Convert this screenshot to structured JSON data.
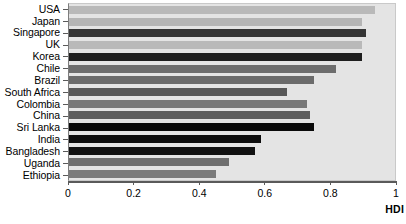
{
  "chart_data": {
    "type": "bar",
    "orientation": "horizontal",
    "title": "",
    "xlabel": "HDI",
    "ylabel": "",
    "xlim": [
      0,
      1
    ],
    "ylim": null,
    "grid": false,
    "legend": null,
    "xticks": [
      0,
      0.2,
      0.4,
      0.6,
      0.8,
      1
    ],
    "xtick_labels": [
      "0",
      "0.2",
      "0.4",
      "0.6",
      "0.8",
      "1"
    ],
    "categories": [
      "USA",
      "Japan",
      "Singapore",
      "UK",
      "Korea",
      "Chile",
      "Brazil",
      "South Africa",
      "Colombia",
      "China",
      "Sri Lanka",
      "India",
      "Bangladesh",
      "Uganda",
      "Ethiopia"
    ],
    "values": [
      0.94,
      0.9,
      0.91,
      0.9,
      0.9,
      0.82,
      0.75,
      0.67,
      0.73,
      0.74,
      0.75,
      0.59,
      0.57,
      0.49,
      0.45
    ],
    "bar_colors": [
      "#b9b9b9",
      "#b5b5b5",
      "#353535",
      "#b9b9b9",
      "#1e1e1e",
      "#6d6d6d",
      "#6b6b6b",
      "#585858",
      "#787878",
      "#5d5d5d",
      "#0a0a0a",
      "#0d0d0d",
      "#111111",
      "#6f6f6f",
      "#7b7b7b"
    ],
    "plot_background": "#e4e4e4",
    "axis_color": "#5a5a5a"
  }
}
